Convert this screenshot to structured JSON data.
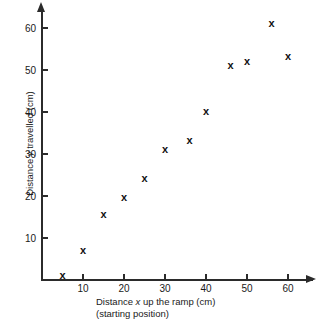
{
  "chart_data": {
    "type": "scatter",
    "title": "",
    "xlabel": "Distance x up the ramp (cm)",
    "xlabel_line2": "(starting position)",
    "ylabel": "Distance y travelled (cm)",
    "xlim": [
      0,
      66
    ],
    "ylim": [
      0,
      64
    ],
    "xticks": [
      10,
      20,
      30,
      40,
      50,
      60
    ],
    "yticks": [
      10,
      20,
      30,
      40,
      50,
      60
    ],
    "grid": false,
    "legend": null,
    "marker": "x",
    "marker_color": "#111111",
    "points": [
      {
        "x": 5,
        "y": 1
      },
      {
        "x": 10,
        "y": 7
      },
      {
        "x": 15,
        "y": 15.5
      },
      {
        "x": 20,
        "y": 19.5
      },
      {
        "x": 25,
        "y": 24
      },
      {
        "x": 30,
        "y": 31
      },
      {
        "x": 36,
        "y": 33
      },
      {
        "x": 40,
        "y": 40
      },
      {
        "x": 46,
        "y": 51
      },
      {
        "x": 50,
        "y": 52
      },
      {
        "x": 56,
        "y": 61
      },
      {
        "x": 60,
        "y": 53
      }
    ]
  },
  "axis": {
    "x_tick_labels": [
      "10",
      "20",
      "30",
      "40",
      "50",
      "60"
    ],
    "y_tick_labels": [
      "10",
      "20",
      "30",
      "40",
      "50",
      "60"
    ],
    "xlabel_prefix": "Distance ",
    "xlabel_var": "x",
    "xlabel_suffix": " up the ramp (cm)",
    "xlabel_sub": "(starting position)",
    "ylabel_prefix": "Distance ",
    "ylabel_var": "y",
    "ylabel_suffix": " travelled (cm)"
  }
}
